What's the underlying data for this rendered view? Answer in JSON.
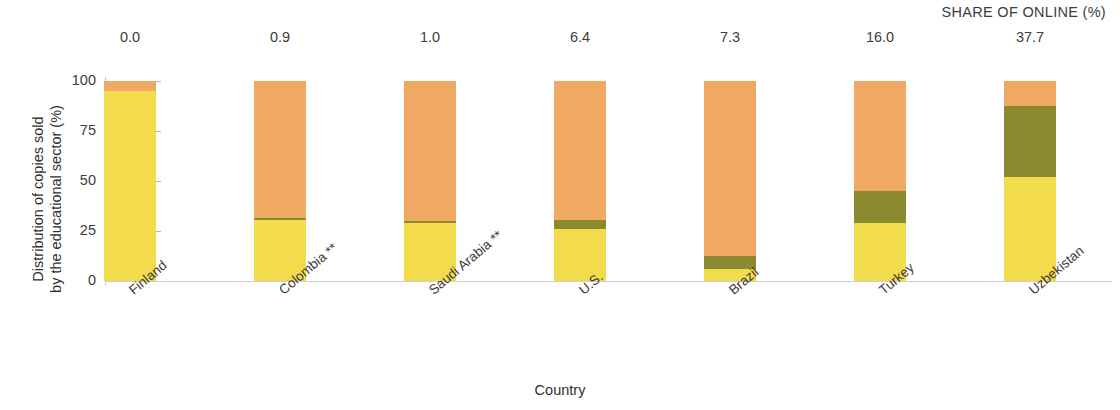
{
  "header": {
    "share_of_online_label": "SHARE OF ONLINE (%)"
  },
  "axes": {
    "ylabel_line1": "Distribution of copies sold",
    "ylabel_line2": "by the educational sector (%)",
    "xlabel": "Country",
    "yticks": [
      "0",
      "25",
      "50",
      "75",
      "100"
    ]
  },
  "chart_data": {
    "type": "bar",
    "subtype": "stacked-bar",
    "title": "",
    "xlabel": "Country",
    "ylabel": "Distribution of copies sold by the educational sector (%)",
    "ylim": [
      0,
      100
    ],
    "yticks": [
      0,
      25,
      50,
      75,
      100
    ],
    "grid": false,
    "legend": "none",
    "stacked": true,
    "stack_order_bottom_to_top": [
      "yellow",
      "green",
      "orange"
    ],
    "colors": {
      "yellow": "#f3dc4b",
      "green": "#8a8a31",
      "orange": "#efa963",
      "axis": "#c6c6c6",
      "text": "#3a3a3a"
    },
    "categories": [
      "Finland",
      "Colombia **",
      "Saudi Arabia **",
      "U.S.",
      "Brazil",
      "Turkey",
      "Uzbekistan"
    ],
    "annotation_row_label": "SHARE OF ONLINE (%)",
    "annotations": [
      "0.0",
      "0.9",
      "1.0",
      "6.4",
      "7.3",
      "16.0",
      "37.7"
    ],
    "series": [
      {
        "name": "yellow",
        "color": "#f3dc4b",
        "values": [
          95.0,
          30.5,
          29.0,
          26.0,
          6.0,
          29.0,
          52.0
        ]
      },
      {
        "name": "green",
        "color": "#8a8a31",
        "values": [
          0.0,
          1.0,
          1.0,
          4.5,
          6.5,
          16.0,
          35.5
        ]
      },
      {
        "name": "orange",
        "color": "#efa963",
        "values": [
          5.0,
          68.5,
          70.0,
          69.5,
          87.5,
          55.0,
          12.5
        ]
      }
    ]
  }
}
